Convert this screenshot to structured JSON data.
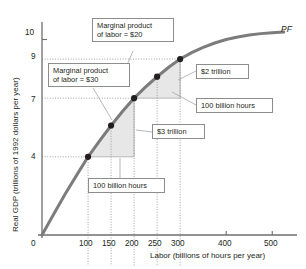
{
  "figure": {
    "curve_label": "PF",
    "y_axis_title": "Real GDP (trillions of 1992 dollars per year)",
    "x_axis_title": "Labor (billions of hours per year)"
  },
  "annotations": {
    "mpl20": "Marginal product\nof labor = $20",
    "mpl30": "Marginal product\nof labor = $30",
    "gain2": "$2 trillion",
    "hours_upper": "100 billion hours",
    "gain3": "$3 trillion",
    "hours_lower": "100 billion hours"
  },
  "chart_data": {
    "type": "line",
    "title": "",
    "xlabel": "Labor (billions of hours per year)",
    "ylabel": "Real GDP (trillions of 1992 dollars per year)",
    "xlim": [
      0,
      560
    ],
    "ylim": [
      0,
      10.8
    ],
    "grid": false,
    "legend_position": "none",
    "series": [
      {
        "name": "PF",
        "x": [
          0,
          25,
          50,
          75,
          100,
          125,
          150,
          175,
          200,
          225,
          250,
          275,
          300,
          325,
          350,
          375,
          400,
          425,
          450,
          475,
          500,
          525
        ],
        "y": [
          0,
          1.05,
          2.08,
          3.05,
          4.0,
          4.82,
          5.6,
          6.33,
          7.0,
          7.58,
          8.1,
          8.58,
          9.0,
          9.33,
          9.6,
          9.82,
          10.0,
          10.13,
          10.23,
          10.3,
          10.35,
          10.38
        ]
      }
    ],
    "markers": [
      {
        "x": 100,
        "y": 4.0
      },
      {
        "x": 150,
        "y": 5.6
      },
      {
        "x": 200,
        "y": 7.0
      },
      {
        "x": 250,
        "y": 8.1
      },
      {
        "x": 300,
        "y": 9.0
      }
    ],
    "x_ticks_labeled": [
      0,
      100,
      150,
      200,
      250,
      300,
      400,
      500
    ],
    "y_ticks_labeled": [
      0,
      4,
      7,
      9,
      10
    ],
    "dotted_guides_y": [
      4,
      7,
      9
    ],
    "dotted_guides_x": [
      100,
      150,
      200,
      250,
      300
    ],
    "shaded_triangles": [
      {
        "name": "lower",
        "x0": 100,
        "y0": 4.0,
        "x1": 200,
        "y1": 7.0,
        "rise": "$3 trillion",
        "run": "100 billion hours",
        "mpl": 30
      },
      {
        "name": "upper",
        "x0": 200,
        "y0": 7.0,
        "x1": 300,
        "y1": 9.0,
        "rise": "$2 trillion",
        "run": "100 billion hours",
        "mpl": 20
      }
    ]
  },
  "ticks": {
    "x": [
      "0",
      "100",
      "150",
      "200",
      "250",
      "300",
      "400",
      "500"
    ],
    "y": [
      "0",
      "4",
      "7",
      "9",
      "10"
    ]
  },
  "colors": {
    "curve": "#7c7c7c",
    "axis": "#6e6e6e",
    "shade": "#e6e6e6",
    "marker": "#231f20",
    "box_border": "#8d8d8d",
    "leader": "#9a9a9a"
  }
}
